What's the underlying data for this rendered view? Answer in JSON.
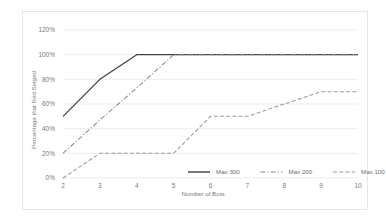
{
  "chart_data": {
    "type": "line",
    "title": "",
    "xlabel": "Number of Bots",
    "ylabel": "Percentage that Red Sieged",
    "x": [
      2,
      3,
      4,
      5,
      6,
      7,
      8,
      9,
      10
    ],
    "xtick_labels": [
      "2",
      "3",
      "4",
      "5",
      "6",
      "7",
      "8",
      "9",
      "10"
    ],
    "ytick_labels": [
      "0%",
      "20%",
      "40%",
      "60%",
      "80%",
      "100%",
      "120%"
    ],
    "ytick_values": [
      0,
      20,
      40,
      60,
      80,
      100,
      120
    ],
    "ylim": [
      0,
      120
    ],
    "xlim": [
      2,
      10
    ],
    "grid": "horizontal",
    "legend_position": "bottom-right-inside",
    "series": [
      {
        "name": "Max 300",
        "values": [
          50,
          80,
          100,
          100,
          100,
          100,
          100,
          100,
          100
        ],
        "color": "#404040",
        "style": "solid"
      },
      {
        "name": "Max 200",
        "values": [
          20,
          47,
          73,
          100,
          100,
          100,
          100,
          100,
          100
        ],
        "color": "#8c8c8c",
        "style": "dash-dot"
      },
      {
        "name": "Max 100",
        "values": [
          0,
          20,
          20,
          20,
          50,
          50,
          60,
          70,
          70
        ],
        "color": "#9a9a9a",
        "style": "dashed"
      }
    ]
  },
  "legend": {
    "items": [
      {
        "label": "Max 300"
      },
      {
        "label": "Max 200"
      },
      {
        "label": "Max 100"
      }
    ]
  },
  "axes": {
    "x_title": "Number of Bots",
    "y_title": "Percentage that Red Sieged"
  }
}
